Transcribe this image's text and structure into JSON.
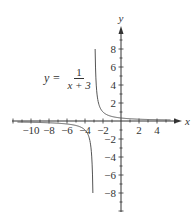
{
  "chart_data": {
    "type": "line",
    "title": "",
    "function": "y = 1/(x+3)",
    "equation_label": {
      "lhs": "y =",
      "numerator": "1",
      "denominator": "x + 3"
    },
    "xlabel": "x",
    "ylabel": "y",
    "xlim": [
      -12,
      6
    ],
    "ylim": [
      -10,
      10
    ],
    "x_ticks": [
      -10,
      -8,
      -6,
      -4,
      -2,
      2,
      4
    ],
    "y_ticks": [
      -8,
      -6,
      -4,
      -2,
      2,
      4,
      6,
      8
    ],
    "x_tick_labels": [
      "−10",
      "−8",
      "−6",
      "−4",
      "−2",
      "2",
      "4"
    ],
    "y_tick_labels": [
      "8",
      "6",
      "4",
      "2",
      "−2",
      "−4",
      "−6",
      "−8"
    ],
    "grid": false,
    "vertical_asymptote": -3,
    "horizontal_asymptote": 0,
    "series": [
      {
        "name": "right branch",
        "x": [
          -2.875,
          -2.8,
          -2.5,
          -2,
          -1,
          0,
          1,
          2,
          4,
          5.5
        ],
        "y": [
          8,
          5,
          2,
          1,
          0.5,
          0.333,
          0.25,
          0.2,
          0.143,
          0.118
        ]
      },
      {
        "name": "left branch",
        "x": [
          -11.5,
          -10,
          -8,
          -6,
          -5,
          -4,
          -3.5,
          -3.2,
          -3.125
        ],
        "y": [
          -0.118,
          -0.143,
          -0.2,
          -0.333,
          -0.5,
          -1,
          -2,
          -5,
          -8
        ]
      }
    ],
    "colors": {
      "axis": "#333333",
      "curve": "#555555"
    }
  },
  "labels": {
    "x_axis": "x",
    "y_axis": "y"
  }
}
